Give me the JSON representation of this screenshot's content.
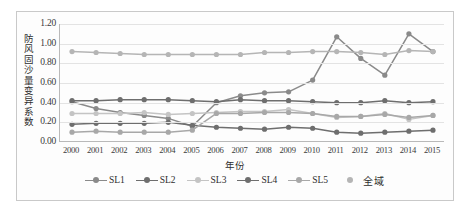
{
  "chart_data": {
    "type": "line",
    "title": "",
    "xlabel": "年份",
    "ylabel": "防风固沙量变异系数",
    "ylim": [
      0.0,
      1.2
    ],
    "ytick_labels": [
      "0.00",
      "0.20",
      "0.40",
      "0.60",
      "0.80",
      "1.00",
      "1.20"
    ],
    "ytick_values": [
      0.0,
      0.2,
      0.4,
      0.6,
      0.8,
      1.0,
      1.2
    ],
    "grid": "horizontal",
    "legend_position": "bottom",
    "categories": [
      "2000",
      "2001",
      "2002",
      "2003",
      "2004",
      "2005",
      "2006",
      "2007",
      "2008",
      "2009",
      "2010",
      "2011",
      "2012",
      "2013",
      "2014",
      "2015"
    ],
    "series": [
      {
        "name": "SL1",
        "color": "#8a8a8a",
        "values": [
          0.41,
          0.34,
          0.3,
          0.27,
          0.24,
          0.16,
          0.4,
          0.47,
          0.5,
          0.51,
          0.63,
          1.07,
          0.85,
          0.68,
          1.1,
          0.92
        ]
      },
      {
        "name": "SL2",
        "color": "#6e6e6e",
        "values": [
          0.42,
          0.42,
          0.43,
          0.43,
          0.43,
          0.42,
          0.41,
          0.43,
          0.42,
          0.42,
          0.41,
          0.4,
          0.4,
          0.42,
          0.4,
          0.41
        ]
      },
      {
        "name": "SL3",
        "color": "#c4c4c4",
        "values": [
          0.29,
          0.29,
          0.29,
          0.3,
          0.28,
          0.29,
          0.3,
          0.31,
          0.31,
          0.33,
          0.29,
          0.25,
          0.26,
          0.29,
          0.23,
          0.27
        ]
      },
      {
        "name": "SL4",
        "color": "#6e6e6e",
        "values": [
          0.18,
          0.19,
          0.19,
          0.19,
          0.2,
          0.17,
          0.15,
          0.14,
          0.13,
          0.15,
          0.14,
          0.1,
          0.09,
          0.1,
          0.11,
          0.12
        ]
      },
      {
        "name": "SL5",
        "color": "#a8a8a8",
        "values": [
          0.1,
          0.11,
          0.1,
          0.1,
          0.1,
          0.12,
          0.29,
          0.29,
          0.3,
          0.3,
          0.29,
          0.26,
          0.26,
          0.28,
          0.25,
          0.27
        ]
      },
      {
        "name": "全域",
        "color": "#b5b5b5",
        "values": [
          0.92,
          0.91,
          0.9,
          0.89,
          0.89,
          0.89,
          0.89,
          0.89,
          0.91,
          0.91,
          0.92,
          0.92,
          0.91,
          0.89,
          0.93,
          0.92
        ]
      }
    ]
  }
}
